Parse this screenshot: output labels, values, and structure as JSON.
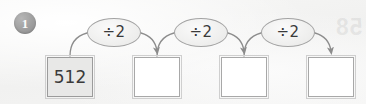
{
  "exercise": {
    "number": "1",
    "bleed_through_text": "58"
  },
  "colors": {
    "page_background": "#f4f4f3",
    "badge_fill": "#9d9d9d",
    "badge_text": "#fbfbfb",
    "box_border": "#a8a8a8",
    "box_fill_empty": "#ffffff",
    "box_fill_given": "#e8e8e7",
    "node_border": "#a3a3a3",
    "node_fill": "#efefee",
    "ink": "#3a3a3a",
    "arrow": "#8c8c8c"
  },
  "boxes": [
    {
      "value": "512",
      "given": true
    },
    {
      "value": "",
      "given": false
    },
    {
      "value": "",
      "given": false
    },
    {
      "value": "",
      "given": false
    }
  ],
  "operators": [
    {
      "label": "÷2"
    },
    {
      "label": "÷2"
    },
    {
      "label": "÷2"
    }
  ]
}
